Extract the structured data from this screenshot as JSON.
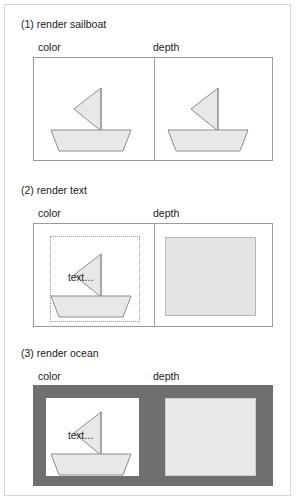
{
  "figure": {
    "background_color": "#ffffff",
    "frame_border_color": "#d8d8d8",
    "shape_fill": "#e8e8e8",
    "shape_stroke": "#8c8c8c",
    "depth_fill": "#e4e4e4",
    "depth_stroke": "#b5b5b5",
    "ocean_color": "#6f6f6f",
    "panel_border_color": "#9a9a9a"
  },
  "column_labels": {
    "color": "color",
    "depth": "depth"
  },
  "sections": [
    {
      "id": "render-sailboat",
      "title": "(1) render sailboat",
      "color_panel": {
        "background": "white",
        "has_sail": true,
        "has_hull": true,
        "has_text": false,
        "has_dotted_box": false,
        "has_ocean": false
      },
      "depth_panel": {
        "background": "white",
        "has_sail": true,
        "has_hull": true,
        "has_depth_rect": false,
        "has_ocean": false
      }
    },
    {
      "id": "render-text",
      "title": "(2) render text",
      "color_panel": {
        "background": "white",
        "has_sail": true,
        "has_hull": true,
        "has_text": true,
        "text": "text…",
        "has_dotted_box": true,
        "has_ocean": false
      },
      "depth_panel": {
        "background": "white",
        "has_sail": false,
        "has_hull": false,
        "has_depth_rect": true,
        "has_ocean": false
      }
    },
    {
      "id": "render-ocean",
      "title": "(3) render ocean",
      "color_panel": {
        "background": "ocean",
        "has_sail": true,
        "has_hull": true,
        "has_text": true,
        "text": "text…",
        "has_dotted_box": false,
        "has_ocean": true
      },
      "depth_panel": {
        "background": "ocean",
        "has_sail": false,
        "has_hull": false,
        "has_depth_rect": true,
        "has_ocean": true
      }
    }
  ]
}
